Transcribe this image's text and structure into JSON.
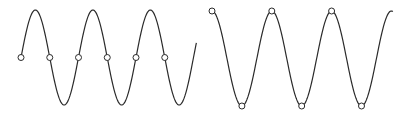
{
  "figure": {
    "colors": {
      "line": "#2a2a2a",
      "marker_fill": "#ffffff",
      "background": "#ffffff"
    },
    "panels": [
      {
        "id": "left",
        "wave": "sine",
        "cycles": 3,
        "phase": "starts at zero crossing, rising",
        "sample_points": "zero crossings",
        "marker_count": 6,
        "markers_at_phase_deg": [
          0,
          180,
          360,
          540,
          720,
          900
        ]
      },
      {
        "id": "right",
        "wave": "cosine",
        "cycles": 3,
        "phase": "starts at peak",
        "sample_points": "peaks and troughs",
        "marker_count": 6,
        "markers_at_phase_deg": [
          0,
          180,
          360,
          540,
          720,
          900
        ]
      }
    ]
  }
}
